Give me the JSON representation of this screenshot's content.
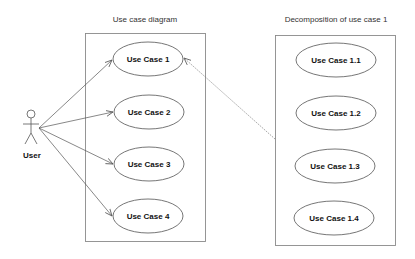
{
  "diagram": {
    "type": "uml-use-case",
    "colors": {
      "background": "#ffffff",
      "boundary": "#8a8a8a",
      "ellipse_stroke": "#666666",
      "text": "#111111",
      "connector": "#555555"
    },
    "actor": {
      "label": "User"
    },
    "left_box": {
      "title": "Use case diagram",
      "use_cases": [
        {
          "label": "Use Case 1"
        },
        {
          "label": "Use Case 2"
        },
        {
          "label": "Use Case 3"
        },
        {
          "label": "Use Case 4"
        }
      ]
    },
    "right_box": {
      "title": "Decomposition of use case 1",
      "use_cases": [
        {
          "label": "Use Case 1.1"
        },
        {
          "label": "Use Case 1.2"
        },
        {
          "label": "Use Case 1.3"
        },
        {
          "label": "Use Case 1.4"
        }
      ]
    },
    "connections": [
      {
        "from": "User",
        "to": "Use Case 1",
        "style": "solid-arrow"
      },
      {
        "from": "User",
        "to": "Use Case 2",
        "style": "solid-arrow"
      },
      {
        "from": "User",
        "to": "Use Case 3",
        "style": "solid-arrow"
      },
      {
        "from": "User",
        "to": "Use Case 4",
        "style": "solid-arrow"
      },
      {
        "from": "Decomposition of use case 1",
        "to": "Use Case 1",
        "style": "dashed-arrow"
      }
    ]
  }
}
